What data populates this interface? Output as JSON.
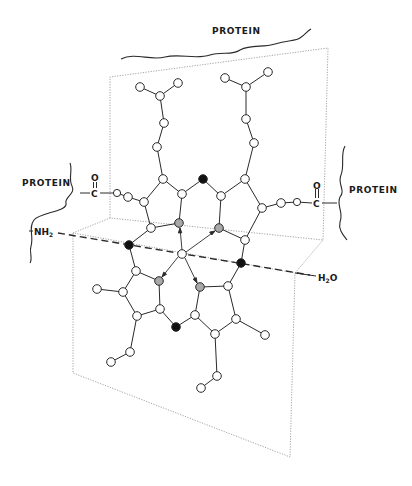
{
  "figure": {
    "type": "heme group in protein pocket (structural diagram)",
    "colors": {
      "line": "#2a2a2a",
      "frame": "#9a9a9a",
      "atom_fill": "#ffffff",
      "iron_atom_fill": "#ffffff",
      "nitrogen_fill": "#a8a8a8",
      "meso_fill": "#111111"
    }
  },
  "labels": {
    "protein_top": "PROTEIN",
    "protein_left": "PROTEIN",
    "protein_right": "PROTEIN",
    "nh2": "NH",
    "nh2_sub": "2",
    "h2o_h": "H",
    "h2o_sub": "2",
    "h2o_o": "O",
    "left_carbon": "C",
    "left_carbonyl_o": "O",
    "right_carbon": "C",
    "right_carbonyl_o": "O"
  },
  "legend_semantics": {
    "open_circle": "carbon / side-chain atom",
    "gray_circle": "pyrrole nitrogen",
    "black_circle": "meso carbon (bridging)",
    "center_circle": "iron (Fe)",
    "dashed_line": "axis through NH2 – Fe – H2O",
    "dotted_box": "protein pocket planes"
  }
}
